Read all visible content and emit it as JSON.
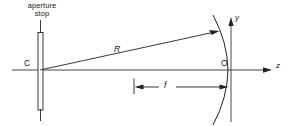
{
  "figure": {
    "type": "optics-ray-diagram",
    "background_color": "#ffffff",
    "ink_color": "#222222",
    "labels": {
      "aperture_stop_line1": "aperture",
      "aperture_stop_line2": "stop",
      "center_of_curvature": "C",
      "radius": "R",
      "focal_length": "f",
      "vertex": "O",
      "axis_y": "y",
      "axis_z": "z"
    }
  },
  "geometry": {
    "optical_axis": {
      "x1": 12,
      "y1": 70,
      "x2": 272,
      "y2": 70
    },
    "aperture_stop": {
      "x": 38,
      "top": 32,
      "bottom": 110,
      "width": 5
    },
    "aperture_stem_top": {
      "x": 40.5,
      "y1": 20,
      "y2": 32
    },
    "aperture_stem_bottom": {
      "x": 40.5,
      "y1": 110,
      "y2": 120
    },
    "radius_line": {
      "x1": 40,
      "y1": 70,
      "x2": 218,
      "y2": 31
    },
    "focal_dim_line": {
      "x1": 134,
      "y1": 87,
      "x2": 228,
      "y2": 87
    },
    "mirror_vertex": {
      "x": 228,
      "y": 70
    },
    "y_axis": {
      "x": 231,
      "y1": 18,
      "y2": 122
    },
    "z_axis_arrow_tip": {
      "x": 272,
      "y": 70
    }
  }
}
